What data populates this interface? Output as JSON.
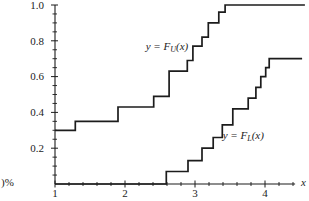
{
  "caption_fragments": {
    "line1": ")%",
    "line2": "or",
    "line3": "bution"
  },
  "chart_data": {
    "type": "line",
    "subtype": "step-function-cdf-confidence-band",
    "title": "",
    "xlabel": "x",
    "ylabel": "",
    "xlim": [
      1,
      4.6
    ],
    "ylim": [
      0,
      1.0
    ],
    "grid": false,
    "line_color": "#1c1c1c",
    "x_ticks_major": [
      1,
      2,
      3,
      4
    ],
    "x_tick_labels": [
      "1",
      "2",
      "3",
      "4"
    ],
    "x_minor_step": 0.2,
    "x_axis_end": 4.43,
    "y_ticks_major": [
      0.2,
      0.4,
      0.6,
      0.8,
      1.0
    ],
    "y_tick_labels": [
      "0.2",
      "0.4",
      "0.6",
      "0.8",
      "1.0"
    ],
    "y_minor_step": 0.05,
    "series": [
      {
        "name": "upper-cdf-bound",
        "label": {
          "prefix": "y = F",
          "subscript": "U",
          "suffix": "(x)",
          "x": 2.6,
          "y": 0.75
        },
        "steps": [
          [
            1.0,
            0.3
          ],
          [
            1.29,
            0.35
          ],
          [
            1.9,
            0.43
          ],
          [
            2.41,
            0.49
          ],
          [
            2.63,
            0.63
          ],
          [
            2.89,
            0.69
          ],
          [
            2.97,
            0.77
          ],
          [
            3.1,
            0.82
          ],
          [
            3.19,
            0.9
          ],
          [
            3.34,
            0.96
          ],
          [
            3.43,
            1.0
          ]
        ],
        "x_end": 4.57
      },
      {
        "name": "lower-cdf-bound",
        "label": {
          "prefix": "y = F",
          "subscript": "L",
          "suffix": "(x)",
          "x": 3.69,
          "y": 0.252
        },
        "steps": [
          [
            1.0,
            0.0
          ],
          [
            2.59,
            0.07
          ],
          [
            2.9,
            0.13
          ],
          [
            3.1,
            0.2
          ],
          [
            3.26,
            0.26
          ],
          [
            3.39,
            0.33
          ],
          [
            3.54,
            0.42
          ],
          [
            3.76,
            0.48
          ],
          [
            3.87,
            0.54
          ],
          [
            3.94,
            0.6
          ],
          [
            4.01,
            0.65
          ],
          [
            4.06,
            0.7
          ]
        ],
        "x_end": 4.53
      }
    ]
  }
}
